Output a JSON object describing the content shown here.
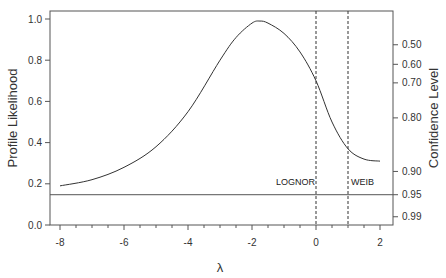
{
  "chart_data": {
    "type": "line",
    "title": "",
    "xlabel": "λ",
    "ylabel": "Profile Likelihood",
    "y2label": "Confidence Level",
    "xlim": [
      -8.3,
      2.4
    ],
    "ylim": [
      0.0,
      1.05
    ],
    "x_ticks": [
      "-8",
      "-6",
      "-4",
      "-2",
      "0",
      "2"
    ],
    "y_ticks": [
      "0.0",
      "0.2",
      "0.4",
      "0.6",
      "0.8",
      "1.0"
    ],
    "y2_ticks": [
      {
        "label": "0.50",
        "at": 0.875
      },
      {
        "label": "0.60",
        "at": 0.78
      },
      {
        "label": "0.70",
        "at": 0.69
      },
      {
        "label": "0.80",
        "at": 0.52
      },
      {
        "label": "0.90",
        "at": 0.26
      },
      {
        "label": "0.95",
        "at": 0.147
      },
      {
        "label": "0.99",
        "at": 0.04
      }
    ],
    "series": [
      {
        "name": "Profile Likelihood",
        "x": [
          -8,
          -7,
          -6,
          -5,
          -4,
          -3,
          -2.5,
          -2,
          -1.75,
          -1.5,
          -1,
          -0.5,
          0,
          0.5,
          1,
          1.5,
          2
        ],
        "values": [
          0.19,
          0.22,
          0.28,
          0.38,
          0.55,
          0.8,
          0.91,
          0.98,
          0.99,
          0.98,
          0.93,
          0.84,
          0.7,
          0.5,
          0.37,
          0.32,
          0.31
        ]
      }
    ],
    "reference_lines": {
      "horizontal": {
        "y": 0.147,
        "label": "95% confidence threshold"
      },
      "vertical": [
        {
          "x": 0,
          "label": "LOGNOR",
          "style": "dashed"
        },
        {
          "x": 1,
          "label": "WEIB",
          "style": "dashed"
        }
      ]
    },
    "grid": false,
    "legend": null
  }
}
